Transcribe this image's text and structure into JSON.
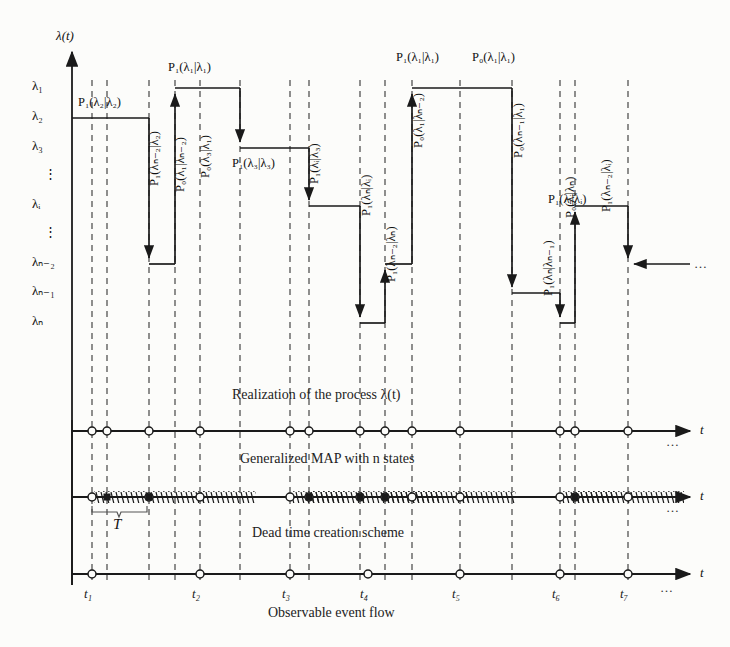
{
  "figure": {
    "y_axis_label": "λ(t)",
    "t_axis_label": "t",
    "duration_label": "T",
    "ellipsis": "…",
    "vdots": "⋮"
  },
  "y_ticks": [
    {
      "label": "λ₁",
      "y": 88
    },
    {
      "label": "λ₂",
      "y": 118
    },
    {
      "label": "λ₃",
      "y": 148
    },
    {
      "label": "⋮",
      "y": 176
    },
    {
      "label": "λᵢ",
      "y": 206
    },
    {
      "label": "⋮",
      "y": 234
    },
    {
      "label": "λₙ₋₂",
      "y": 264
    },
    {
      "label": "λₙ₋₁",
      "y": 293
    },
    {
      "label": "λₙ",
      "y": 323
    }
  ],
  "captions": [
    {
      "text": "Realization of the process λ(t)",
      "x": 232,
      "y": 398
    },
    {
      "text": "Generalized MAP with n states",
      "x": 240,
      "y": 462
    },
    {
      "text": "Dead time creation scheme",
      "x": 252,
      "y": 536
    },
    {
      "text": "Observable event flow",
      "x": 268,
      "y": 616
    }
  ],
  "probability_labels": [
    {
      "text": "P₁(λ₂|λ₂)",
      "x": 78,
      "y": 95,
      "orient": "horizontal"
    },
    {
      "text": "P₁(λₙ₋₂|λ₂)",
      "x": 146,
      "y": 186,
      "orient": "vertical"
    },
    {
      "text": "P₀(λ₁|λₙ₋₂)",
      "x": 172,
      "y": 192,
      "orient": "vertical"
    },
    {
      "text": "P₁(λ₁|λ₁)",
      "x": 168,
      "y": 60,
      "orient": "horizontal"
    },
    {
      "text": "P₀(λ₃|λ₁)",
      "x": 198,
      "y": 178,
      "orient": "vertical"
    },
    {
      "text": "P₁(λ₃|λ₃)",
      "x": 232,
      "y": 156,
      "orient": "horizontal"
    },
    {
      "text": "P₁(λᵢ|λ₃)",
      "x": 307,
      "y": 184,
      "orient": "vertical"
    },
    {
      "text": "P₁(λₙ|λᵢ)",
      "x": 358,
      "y": 216,
      "orient": "vertical"
    },
    {
      "text": "P₁(λₙ₋₂|λₙ)",
      "x": 383,
      "y": 282,
      "orient": "vertical"
    },
    {
      "text": "P₀(λ₁|λₙ₋₂)",
      "x": 410,
      "y": 148,
      "orient": "vertical"
    },
    {
      "text": "P₁(λ₁|λ₁)",
      "x": 396,
      "y": 50,
      "orient": "horizontal"
    },
    {
      "text": "P₀(λ₁|λ₁)",
      "x": 472,
      "y": 50,
      "orient": "horizontal"
    },
    {
      "text": "P₀(λₙ₋₁|λ₁)",
      "x": 510,
      "y": 158,
      "orient": "vertical"
    },
    {
      "text": "P₁(λₙ|λₙ₋₁)",
      "x": 540,
      "y": 296,
      "orient": "vertical"
    },
    {
      "text": "P₀(λᵢ|λₙ)",
      "x": 562,
      "y": 218,
      "orient": "vertical"
    },
    {
      "text": "P₁(λᵢ|λᵢ)",
      "x": 548,
      "y": 192,
      "orient": "horizontal"
    },
    {
      "text": "P₁(λₙ₋₂|λᵢ)",
      "x": 598,
      "y": 212,
      "orient": "vertical"
    }
  ],
  "step_levels": {
    "lambda1": 88,
    "lambda2": 118,
    "lambda3": 148,
    "lambdai": 206,
    "lambdan2": 264,
    "lambdan1": 293,
    "lambdan": 323
  },
  "timelines": [
    {
      "name": "realization",
      "y": 431,
      "events_x": [
        92,
        107,
        149,
        200,
        290,
        309,
        360,
        385,
        412,
        460,
        560,
        575,
        628
      ]
    },
    {
      "name": "generalized-map",
      "y": 497,
      "events_x": [
        92,
        149,
        200,
        290,
        309,
        360,
        385,
        412,
        460,
        560,
        575,
        628
      ],
      "lost_x": [
        107,
        149,
        309,
        360,
        385,
        575
      ]
    },
    {
      "name": "observable-flow",
      "y": 574,
      "events_x": [
        92,
        200,
        290,
        368,
        460,
        560,
        628
      ]
    }
  ],
  "time_ticks": [
    {
      "label": "t₁",
      "x": 92
    },
    {
      "label": "t₂",
      "x": 200
    },
    {
      "label": "t₃",
      "x": 290
    },
    {
      "label": "t₄",
      "x": 368
    },
    {
      "label": "t₅",
      "x": 460
    },
    {
      "label": "t₆",
      "x": 560
    },
    {
      "label": "t₇",
      "x": 628
    }
  ],
  "dashed_guides_x": [
    92,
    107,
    149,
    175,
    200,
    240,
    290,
    309,
    360,
    385,
    412,
    460,
    512,
    560,
    575,
    628
  ],
  "colors": {
    "ink": "#1a1a1a",
    "background": "#fcfcfa",
    "dash": "#333333"
  }
}
